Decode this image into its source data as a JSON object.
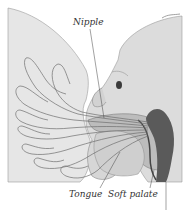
{
  "figure": {
    "labels": {
      "nipple": "Nipple",
      "tongue": "Tongue",
      "soft_palate": "Soft palate"
    }
  },
  "colors": {
    "background": "#ffffff",
    "skin_light": "#e6e6e6",
    "skin_mid": "#cfcfcf",
    "shadow": "#8a8a8a",
    "dark_cavity": "#555555",
    "duct_line": "#6f6f6f",
    "label_text": "#333333",
    "leader_line": "#444444"
  }
}
